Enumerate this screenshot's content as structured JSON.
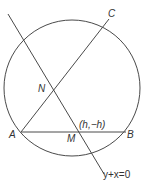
{
  "diagram": {
    "type": "geometry",
    "colors": {
      "stroke": "#4a4a4a",
      "text": "#333333",
      "background": "#ffffff"
    },
    "points": {
      "A": {
        "label": "A"
      },
      "B": {
        "label": "B"
      },
      "C": {
        "label": "C"
      },
      "N": {
        "label": "N"
      },
      "M": {
        "label": "M"
      }
    },
    "annotations": {
      "m_coords": "(h,−h)",
      "line_equation": "y+x=0"
    }
  }
}
